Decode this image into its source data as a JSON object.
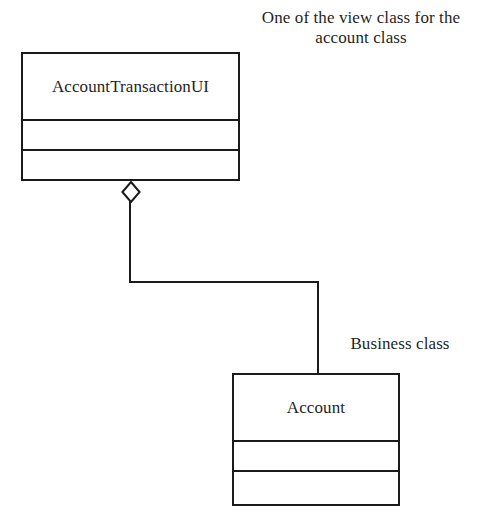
{
  "diagram": {
    "type": "uml-class-diagram",
    "background_color": "#ffffff",
    "line_color": "#1a1a1a",
    "text_color": "#1f1f1f",
    "annotations": [
      {
        "name": "note-view-class",
        "text": "One of the view class for the\naccount class",
        "lines": [
          "One of the view class for the",
          "account class"
        ],
        "align": "center"
      },
      {
        "name": "note-business-class",
        "text": "Business class",
        "lines": [
          "Business class"
        ],
        "align": "center"
      }
    ],
    "classes": [
      {
        "name": "AccountTransactionUI",
        "role": "view",
        "compartments": {
          "name": "AccountTransactionUI",
          "attributes": "",
          "operations": ""
        }
      },
      {
        "name": "Account",
        "role": "business",
        "compartments": {
          "name": "Account",
          "attributes": "",
          "operations": ""
        }
      }
    ],
    "relationships": [
      {
        "name": "aggregation-account-transaction-ui-account",
        "type": "aggregation",
        "marker": "hollow-diamond",
        "source": "AccountTransactionUI",
        "target": "Account",
        "routing": "orthogonal"
      }
    ]
  }
}
